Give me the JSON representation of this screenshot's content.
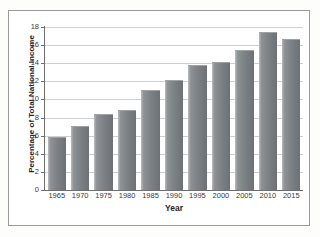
{
  "chart_data": {
    "type": "bar",
    "title": "",
    "subtitle": "",
    "xlabel": "Year",
    "ylabel": "Percentage of Total National Income",
    "categories": [
      "1965",
      "1970",
      "1975",
      "1980",
      "1985",
      "1990",
      "1995",
      "2000",
      "2005",
      "2010",
      "2015"
    ],
    "values": [
      5.9,
      7.1,
      8.35,
      8.8,
      11.0,
      12.1,
      13.85,
      14.1,
      15.5,
      17.5,
      16.7
    ],
    "ylim": [
      0,
      18
    ],
    "ytick_labels": [
      "0",
      "2",
      "4",
      "6",
      "8",
      "10",
      "12",
      "14",
      "16",
      "18"
    ],
    "ytick_values": [
      0,
      2,
      4,
      6,
      8,
      10,
      12,
      14,
      16,
      18
    ],
    "grid": "horizontal",
    "legend": "none",
    "bar_color": "#7e8387",
    "gridline_color": "#cfcfcf",
    "axis_color": "#6e6e6e",
    "frame_color": "#9a9a9a",
    "background_color": "#ffffff"
  }
}
